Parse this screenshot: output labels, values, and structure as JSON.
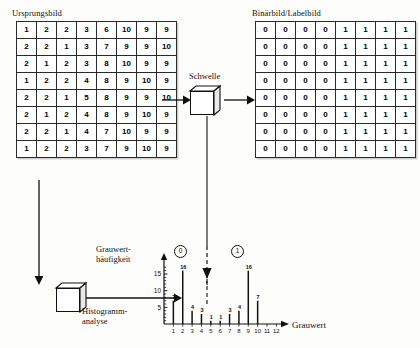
{
  "diagram": {
    "title_source": "Ursprungsbild",
    "title_binary": "Binärbild/Labelbild",
    "threshold_label": "Schwelle",
    "histogram_block_label_line1": "Histogramm-",
    "histogram_block_label_line2": "analyse",
    "y_axis_label_line1": "Grauwert-",
    "y_axis_label_line2": "häufigkeit",
    "x_axis_label": "Grauwert",
    "region_marker_background": "0",
    "region_marker_object": "1"
  },
  "source_image": {
    "rows": [
      [
        1,
        2,
        2,
        3,
        6,
        10,
        9,
        9
      ],
      [
        2,
        2,
        1,
        3,
        7,
        9,
        9,
        10
      ],
      [
        2,
        1,
        2,
        3,
        8,
        10,
        9,
        9
      ],
      [
        1,
        2,
        2,
        4,
        8,
        9,
        10,
        9
      ],
      [
        2,
        2,
        1,
        5,
        8,
        9,
        9,
        10
      ],
      [
        2,
        1,
        2,
        4,
        8,
        9,
        10,
        9
      ],
      [
        2,
        2,
        1,
        4,
        7,
        10,
        9,
        9
      ],
      [
        1,
        2,
        2,
        3,
        7,
        9,
        10,
        9
      ]
    ]
  },
  "binary_image": {
    "rows": [
      [
        0,
        0,
        0,
        0,
        1,
        1,
        1,
        1
      ],
      [
        0,
        0,
        0,
        0,
        1,
        1,
        1,
        1
      ],
      [
        0,
        0,
        0,
        0,
        1,
        1,
        1,
        1
      ],
      [
        0,
        0,
        0,
        0,
        1,
        1,
        1,
        1
      ],
      [
        0,
        0,
        0,
        0,
        1,
        1,
        1,
        1
      ],
      [
        0,
        0,
        0,
        0,
        1,
        1,
        1,
        1
      ],
      [
        0,
        0,
        0,
        0,
        1,
        1,
        1,
        1
      ],
      [
        0,
        0,
        0,
        0,
        1,
        1,
        1,
        1
      ]
    ]
  },
  "chart_data": {
    "type": "bar",
    "title": "",
    "xlabel": "Grauwert",
    "ylabel": "Grauwerthäufigkeit",
    "categories": [
      1,
      2,
      3,
      4,
      5,
      6,
      7,
      8,
      9,
      10,
      11,
      12
    ],
    "values": [
      7,
      16,
      4,
      3,
      1,
      1,
      3,
      4,
      16,
      7,
      0,
      0
    ],
    "bar_labels": [
      "7",
      "16",
      "4",
      "3",
      "1",
      "1",
      "3",
      "4",
      "16",
      "7",
      "",
      ""
    ],
    "xlim": [
      0,
      12
    ],
    "ylim": [
      0,
      18
    ],
    "yticks": [
      5,
      10,
      15
    ],
    "ytick_labels": [
      "5",
      "10",
      "15"
    ],
    "xtick_labels": [
      "1",
      "2",
      "3",
      "4",
      "5",
      "6",
      "7",
      "8",
      "9",
      "10",
      "11",
      "12"
    ],
    "grid": false,
    "legend": "none",
    "annotations": [
      {
        "text": "0",
        "x": 2,
        "note": "circled region label for background peak"
      },
      {
        "text": "1",
        "x": 9,
        "note": "circled region label for object peak"
      },
      {
        "text": "threshold",
        "x": 5.6,
        "note": "dashed vertical threshold arrow from Schwelle"
      }
    ]
  },
  "colors": {
    "ink": "#111111",
    "paper": "#fdfdfb",
    "cell_border": "#2a2a2a"
  }
}
